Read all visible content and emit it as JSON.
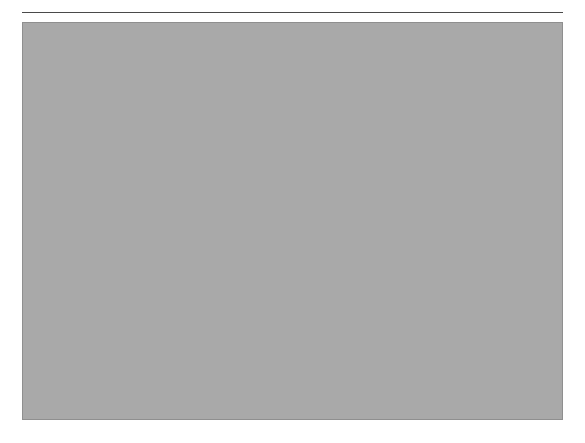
{
  "page": {
    "width": 585,
    "height": 443,
    "background": "#ffffff"
  },
  "rule": {
    "name": "top-horizontal-rule",
    "color": "#4a4a4a"
  },
  "panel": {
    "background": "#a9a9a9",
    "border_color": "#8f8f8f",
    "x": 22,
    "y": 22,
    "width": 541,
    "height": 398
  },
  "node_style": {
    "fill": "#ffffff",
    "stroke": "#6b6b6b",
    "text_color": "#3a3a3a"
  },
  "edge_style": {
    "solid_color": "#6f6f6f",
    "dashed_color": "#8a8a8a",
    "dash_pattern": "4,4"
  },
  "diagram": {
    "type": "tree",
    "depth_labels": [
      "Level 0",
      "Level 1",
      "Level 2",
      "Level 3"
    ],
    "nodes": [
      {
        "id": "n0",
        "label": "Level 0",
        "level": 0,
        "x": 243,
        "y": 29,
        "w": 66,
        "h": 39
      },
      {
        "id": "n1a",
        "label": "Level 1",
        "level": 1,
        "x": 76,
        "y": 128,
        "w": 63,
        "h": 45
      },
      {
        "id": "n1b",
        "label": "Level 1",
        "level": 1,
        "x": 285,
        "y": 128,
        "w": 63,
        "h": 45
      },
      {
        "id": "n1c",
        "label": "Level 1",
        "level": 1,
        "x": 452,
        "y": 128,
        "w": 63,
        "h": 45
      },
      {
        "id": "n2a",
        "label": "Level 2",
        "level": 2,
        "x": 30,
        "y": 225,
        "w": 60,
        "h": 43
      },
      {
        "id": "n2b",
        "label": "Level 2",
        "level": 2,
        "x": 117,
        "y": 225,
        "w": 60,
        "h": 43
      },
      {
        "id": "n2c",
        "label": "Level 2",
        "level": 2,
        "x": 204,
        "y": 225,
        "w": 60,
        "h": 43
      },
      {
        "id": "n2d",
        "label": "Level 2",
        "level": 2,
        "x": 291,
        "y": 225,
        "w": 60,
        "h": 43
      },
      {
        "id": "n2e",
        "label": "Level 2",
        "level": 2,
        "x": 378,
        "y": 225,
        "w": 60,
        "h": 43
      },
      {
        "id": "n2f",
        "label": "Level 2",
        "level": 2,
        "x": 465,
        "y": 225,
        "w": 60,
        "h": 43
      },
      {
        "id": "n3a",
        "label": "Level 3",
        "level": 3,
        "x": 30,
        "y": 324,
        "w": 64,
        "h": 45
      },
      {
        "id": "n3b",
        "label": "Level 3",
        "level": 3,
        "x": 124,
        "y": 324,
        "w": 64,
        "h": 45
      },
      {
        "id": "n3c",
        "label": "Level 3",
        "level": 3,
        "x": 218,
        "y": 324,
        "w": 64,
        "h": 45
      },
      {
        "id": "n3d",
        "label": "Level 3",
        "level": 3,
        "x": 348,
        "y": 324,
        "w": 64,
        "h": 45
      },
      {
        "id": "n3e",
        "label": "Level 3",
        "level": 3,
        "x": 430,
        "y": 324,
        "w": 64,
        "h": 45
      }
    ],
    "edges": [
      {
        "from": "n0",
        "to": "n1a",
        "style": "solid"
      },
      {
        "from": "n0",
        "to": "n1b",
        "style": "solid"
      },
      {
        "from": "n0",
        "to": "n1c",
        "style": "solid"
      },
      {
        "from": "n1a",
        "to": "n2a",
        "style": "solid"
      },
      {
        "from": "n1a",
        "to": "n2b",
        "style": "solid"
      },
      {
        "from": "n1b",
        "to": "n2c",
        "style": "solid"
      },
      {
        "from": "n1b",
        "to": "n2d",
        "style": "solid"
      },
      {
        "from": "n1b",
        "to": "n2e",
        "style": "solid"
      },
      {
        "from": "n1c",
        "to": "n2f",
        "style": "solid"
      },
      {
        "from": "n2a",
        "to": "n3a",
        "style": "dashed"
      },
      {
        "from": "n2b",
        "to": "n3a",
        "style": "solid"
      },
      {
        "from": "n2b",
        "to": "n3b",
        "style": "solid"
      },
      {
        "from": "n2b",
        "to": "n3c",
        "style": "solid"
      },
      {
        "from": "n2c",
        "to": "n3c",
        "style": "dashed"
      },
      {
        "from": "n2d",
        "to": "n3d",
        "style": "dashed"
      },
      {
        "from": "n2e",
        "to": "n3d",
        "style": "solid"
      },
      {
        "from": "n2e",
        "to": "n3e",
        "style": "solid"
      },
      {
        "from": "n2f",
        "to": "n3e",
        "style": "dashed"
      }
    ],
    "sibling_links": [
      {
        "from": "n2c",
        "to": "n2d",
        "style": "dashed"
      },
      {
        "from": "n3a",
        "to": "n3b",
        "style": "dashed"
      },
      {
        "from": "n3b",
        "to": "n3c",
        "style": "dashed"
      },
      {
        "from": "n3d",
        "to": "n3e",
        "style": "dashed"
      }
    ],
    "edge_stubs": [
      {
        "id": "stub-left",
        "at": "n2a",
        "side": "left",
        "length": 14,
        "style": "dashed"
      },
      {
        "id": "stub-right",
        "at": "n2f",
        "side": "right",
        "length": 14,
        "style": "dashed"
      }
    ]
  }
}
